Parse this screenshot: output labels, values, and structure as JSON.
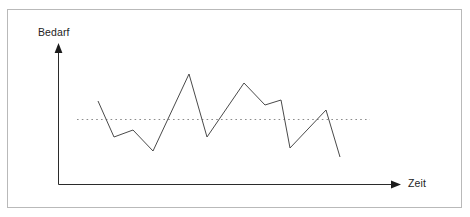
{
  "diagram": {
    "background_color": "#ffffff",
    "frame": {
      "border_color": "#b9b9b9"
    },
    "axes": {
      "y_axis_label": "Bedarf",
      "x_axis_label": "Zeit",
      "axis_color": "#2b2b2b",
      "y_axis_x": 58,
      "y_axis_top": 44,
      "x_axis_y": 184,
      "x_axis_right": 400,
      "arrow_style": "filled-triangle"
    },
    "reference_line": {
      "name": "average-demand-line",
      "style": "dotted",
      "color": "#8c8c8c",
      "y": 119,
      "x_start": 77,
      "x_end": 370
    },
    "series": {
      "name": "demand-over-time",
      "color": "#4a4a4a",
      "stroke_width": 1,
      "points": [
        [
          98,
          101
        ],
        [
          114,
          137
        ],
        [
          133,
          130
        ],
        [
          153,
          151
        ],
        [
          189,
          74
        ],
        [
          207,
          137
        ],
        [
          244,
          83
        ],
        [
          265,
          105
        ],
        [
          281,
          100
        ],
        [
          290,
          148
        ],
        [
          326,
          110
        ],
        [
          340,
          157
        ]
      ]
    }
  },
  "chart_data": {
    "type": "line",
    "title": "",
    "xlabel": "Zeit",
    "ylabel": "Bedarf",
    "grid": false,
    "legend": "none",
    "axis_ticks": "none",
    "x": [
      0,
      1,
      2,
      3,
      4,
      5,
      6,
      7,
      8,
      9,
      10,
      11
    ],
    "series": [
      {
        "name": "Bedarf",
        "values": [
          60,
          31,
          37,
          21,
          83,
          31,
          76,
          58,
          62,
          23,
          54,
          16
        ]
      }
    ],
    "annotations": [
      {
        "type": "hline",
        "label": "Mittlerer Bedarf",
        "value": 46,
        "style": "dotted"
      }
    ],
    "ylim": [
      0,
      100
    ],
    "xlim": [
      0,
      11
    ]
  }
}
